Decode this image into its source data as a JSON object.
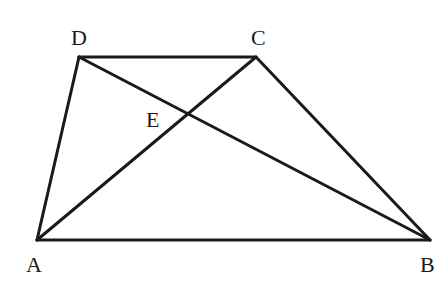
{
  "diagram": {
    "points": {
      "A": {
        "label": "A",
        "x": 37,
        "y": 240,
        "lx": 26,
        "ly": 272
      },
      "B": {
        "label": "B",
        "x": 430,
        "y": 240,
        "lx": 420,
        "ly": 272
      },
      "C": {
        "label": "C",
        "x": 256,
        "y": 57,
        "lx": 251,
        "ly": 45
      },
      "D": {
        "label": "D",
        "x": 79,
        "y": 57,
        "lx": 71,
        "ly": 45
      },
      "E": {
        "label": "E",
        "x": 188,
        "y": 114,
        "lx": 146,
        "ly": 127
      }
    },
    "segments": [
      {
        "name": "AB",
        "from": "A",
        "to": "B"
      },
      {
        "name": "BC",
        "from": "B",
        "to": "C"
      },
      {
        "name": "CD",
        "from": "C",
        "to": "D"
      },
      {
        "name": "DA",
        "from": "D",
        "to": "A"
      },
      {
        "name": "AC",
        "from": "A",
        "to": "C"
      },
      {
        "name": "DB",
        "from": "D",
        "to": "B"
      }
    ],
    "stroke_color": "#1a1a1a",
    "background": "#ffffff"
  }
}
